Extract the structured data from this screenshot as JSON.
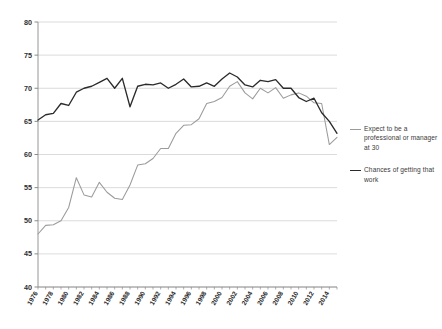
{
  "chart_data": {
    "type": "line",
    "title": "",
    "subtitle": "",
    "xlabel": "",
    "ylabel": "",
    "xlim": [
      1976,
      2015
    ],
    "ylim": [
      40,
      80
    ],
    "yticks": [
      40,
      45,
      50,
      55,
      60,
      65,
      70,
      75,
      80
    ],
    "ytick_labels": [
      "40",
      "45",
      "50",
      "55",
      "60",
      "65",
      "70",
      "75",
      "80"
    ],
    "xticks": [
      1976,
      1978,
      1980,
      1982,
      1984,
      1986,
      1988,
      1990,
      1992,
      1994,
      1996,
      1998,
      2000,
      2002,
      2004,
      2006,
      2008,
      2010,
      2012,
      2014
    ],
    "xtick_labels": [
      "1976",
      "1978",
      "1980",
      "1982",
      "1984",
      "1986",
      "1988",
      "1990",
      "1992",
      "1994",
      "1996",
      "1998",
      "2000",
      "2002",
      "2004",
      "2006",
      "2008",
      "2010",
      "2012",
      "2014"
    ],
    "xtick_rotation": 60,
    "grid": "horizontal",
    "legend_position": "right",
    "x": [
      1976,
      1977,
      1978,
      1979,
      1980,
      1981,
      1982,
      1983,
      1984,
      1985,
      1986,
      1987,
      1988,
      1989,
      1990,
      1991,
      1992,
      1993,
      1994,
      1995,
      1996,
      1997,
      1998,
      1999,
      2000,
      2001,
      2002,
      2003,
      2004,
      2005,
      2006,
      2007,
      2008,
      2009,
      2010,
      2011,
      2012,
      2013,
      2014,
      2015
    ],
    "series": [
      {
        "name": "Expect to be a professional or manager at 30",
        "color": "#9b9b9b",
        "values": [
          48.0,
          49.3,
          49.4,
          50.0,
          52.0,
          56.5,
          53.9,
          53.6,
          55.8,
          54.3,
          53.4,
          53.2,
          55.4,
          58.4,
          58.6,
          59.4,
          60.9,
          60.9,
          63.2,
          64.4,
          64.5,
          65.4,
          67.7,
          68.0,
          68.6,
          70.3,
          71.0,
          69.3,
          68.4,
          70.0,
          69.3,
          70.1,
          68.5,
          69.0,
          69.3,
          68.8,
          67.8,
          67.7,
          61.5,
          62.6
        ]
      },
      {
        "name": "Chances of getting that work",
        "color": "#2b2b2b",
        "values": [
          65.2,
          66.0,
          66.2,
          67.7,
          67.4,
          69.4,
          70.0,
          70.3,
          70.9,
          71.5,
          70.0,
          71.5,
          67.2,
          70.3,
          70.6,
          70.5,
          70.8,
          70.0,
          70.6,
          71.4,
          70.2,
          70.3,
          70.8,
          70.3,
          71.4,
          72.3,
          71.7,
          70.5,
          70.2,
          71.2,
          71.0,
          71.3,
          70.0,
          70.0,
          68.6,
          68.0,
          68.5,
          66.3,
          65.0,
          63.2
        ]
      }
    ]
  },
  "legend": {
    "entries": [
      {
        "label": "Expect to be a professional or manager at 30",
        "swatch": "gray"
      },
      {
        "label": "Chances of getting that work",
        "swatch": "black"
      }
    ]
  }
}
